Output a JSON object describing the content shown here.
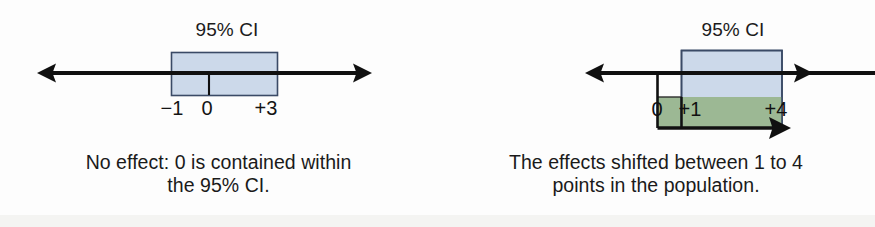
{
  "figure": {
    "type": "confidence-interval-illustration",
    "panels": [
      {
        "id": "no-effect",
        "ci_label": "95% CI",
        "axis_ticks": [
          "−1",
          "0",
          "+3"
        ],
        "tick_values": [
          -1,
          0,
          3
        ],
        "ci_lower": -1,
        "ci_upper": 3,
        "point_of_interest": 0,
        "caption_line1": "No effect: 0 is contained within",
        "caption_line2": "the 95% CI.",
        "box_fill": "#ccd9ea",
        "box_stroke": "#3a4a66"
      },
      {
        "id": "shifted-effect",
        "ci_label": "95% CI",
        "axis_ticks": [
          "0",
          "+1",
          "+4"
        ],
        "tick_values": [
          0,
          1,
          4
        ],
        "ci_lower": 1,
        "ci_upper": 4,
        "point_of_interest": 0,
        "caption_line1": "The effects shifted between 1 to 4",
        "caption_line2": "points in the population.",
        "box_fill": "#ccd9ea",
        "box_stroke": "#3a4a66",
        "effect_fill": "#9cb894",
        "effect_stroke": "#2b2b2b"
      }
    ],
    "axis_color": "#101010"
  }
}
